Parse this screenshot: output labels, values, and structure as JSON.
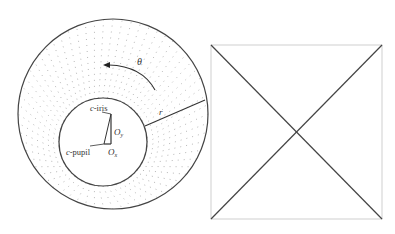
{
  "figure": {
    "left_panel": {
      "description": "Iris polar model with offset pupil",
      "outer_circle": {
        "cx": 113,
        "cy": 114,
        "r": 95
      },
      "inner_circle": {
        "cx": 103,
        "cy": 142,
        "r": 44
      },
      "labels": {
        "theta": "θ",
        "r": "r",
        "c_iris_prefix": "c",
        "c_iris_suffix": "-iris",
        "c_pupil_prefix": "c",
        "c_pupil_suffix": "-pupil",
        "o_y_main": "O",
        "o_y_sub": "y",
        "o_x_main": "O",
        "o_x_sub": "x"
      }
    },
    "right_panel": {
      "description": "Unwrapped rectangle with diagonals",
      "square": {
        "x": 211,
        "y": 45,
        "w": 171,
        "h": 174
      }
    },
    "colors": {
      "stroke": "#444444",
      "dots": "#9a9a9a",
      "square_border": "#cfcfcf"
    }
  }
}
